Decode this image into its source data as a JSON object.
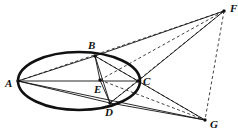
{
  "figure": {
    "type": "geometry-diagram",
    "background_color": "#ffffff",
    "ink_color": "#111111",
    "width": 238,
    "height": 140,
    "ellipse": {
      "name": "main-ellipse",
      "cx": 79,
      "cy": 81,
      "rx": 61,
      "ry": 29,
      "stroke_width": 2.6,
      "style": "solid"
    },
    "points": [
      {
        "id": "A",
        "label": "A",
        "x": 18,
        "y": 81,
        "label_x": 5,
        "label_y": 78,
        "on_ellipse": true,
        "marker": true
      },
      {
        "id": "B",
        "label": "B",
        "x": 95,
        "y": 56,
        "label_x": 88,
        "label_y": 40,
        "on_ellipse": true,
        "marker": true
      },
      {
        "id": "C",
        "label": "C",
        "x": 138,
        "y": 81,
        "label_x": 143,
        "label_y": 76,
        "on_ellipse": true,
        "marker": true
      },
      {
        "id": "D",
        "label": "D",
        "x": 110,
        "y": 103,
        "label_x": 105,
        "label_y": 107,
        "on_ellipse": true,
        "marker": true
      },
      {
        "id": "E",
        "label": "E",
        "x": 100,
        "y": 80,
        "label_x": 94,
        "label_y": 84,
        "on_ellipse": false,
        "marker": true
      },
      {
        "id": "F",
        "label": "F",
        "x": 224,
        "y": 11,
        "label_x": 230,
        "label_y": 3,
        "on_ellipse": false,
        "marker": true
      },
      {
        "id": "G",
        "label": "G",
        "x": 205,
        "y": 120,
        "label_x": 210,
        "label_y": 119,
        "on_ellipse": false,
        "marker": true
      }
    ],
    "solid_segments": [
      {
        "id": "A-C",
        "from": "A",
        "to": "C"
      },
      {
        "id": "A-B",
        "from": "A",
        "to": "B"
      },
      {
        "id": "A-D",
        "from": "A",
        "to": "D"
      },
      {
        "id": "A-G",
        "from": "A",
        "to": "G"
      },
      {
        "id": "B-E",
        "from": "B",
        "to": "E"
      },
      {
        "id": "B-C",
        "from": "B",
        "to": "C"
      },
      {
        "id": "B-D",
        "from": "B",
        "to": "D"
      },
      {
        "id": "B-F",
        "from": "B",
        "to": "F"
      },
      {
        "id": "C-D",
        "from": "C",
        "to": "D"
      },
      {
        "id": "C-F",
        "from": "C",
        "to": "F"
      },
      {
        "id": "C-G",
        "from": "C",
        "to": "G"
      },
      {
        "id": "D-G",
        "from": "D",
        "to": "G"
      },
      {
        "id": "E-D",
        "from": "E",
        "to": "D"
      }
    ],
    "dashed_segments": [
      {
        "id": "A-F",
        "from": "A",
        "to": "F"
      },
      {
        "id": "E-F",
        "from": "E",
        "to": "F"
      },
      {
        "id": "E-G",
        "from": "E",
        "to": "G"
      },
      {
        "id": "D-F",
        "from": "D",
        "to": "F"
      },
      {
        "id": "B-G",
        "from": "B",
        "to": "G"
      },
      {
        "id": "F-G",
        "from": "F",
        "to": "G"
      }
    ]
  }
}
